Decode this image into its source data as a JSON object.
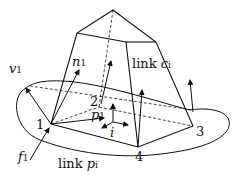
{
  "diagram": {
    "labels": {
      "v": "v",
      "v_sub": "1",
      "n": "n",
      "n_sub": "1",
      "f": "f",
      "f_sub": "1",
      "p": "p",
      "p_sub": "1",
      "i": "i",
      "link_c": "link ",
      "link_c_var": "c",
      "link_c_sub": "i",
      "link_p": "link ",
      "link_p_var": "p",
      "link_p_sub": "i",
      "v1": "1",
      "v2": "2",
      "v3": "3",
      "v4": "4"
    },
    "colors": {
      "stroke": "#111111",
      "background": "#ffffff"
    }
  }
}
